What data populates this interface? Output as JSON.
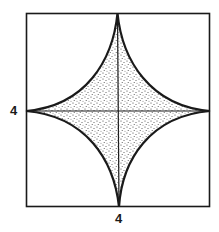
{
  "diagram": {
    "shape": "astroid inscribed in square, shaded region",
    "labels": {
      "left": "4",
      "bottom": "4"
    },
    "colors": {
      "stroke": "#1a1a1a",
      "fill_dots": "#333333",
      "background": "#ffffff"
    }
  }
}
